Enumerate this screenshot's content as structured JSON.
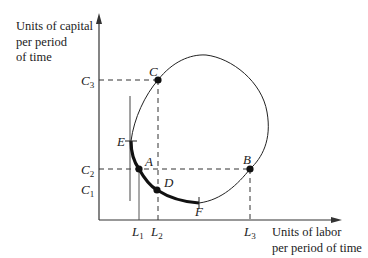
{
  "y_axis": {
    "label_lines": [
      "Units of capital",
      "per period",
      "of time"
    ]
  },
  "x_axis": {
    "label_lines": [
      "Units of labor",
      "per period of time"
    ]
  },
  "y_ticks": [
    {
      "main": "C",
      "sub": "3",
      "y": 80
    },
    {
      "main": "C",
      "sub": "2",
      "y": 169
    },
    {
      "main": "C",
      "sub": "1",
      "y": 190
    }
  ],
  "x_ticks": [
    {
      "main": "L",
      "sub": "1",
      "x": 139
    },
    {
      "main": "L",
      "sub": "2",
      "x": 157
    },
    {
      "main": "L",
      "sub": "3",
      "x": 250
    }
  ],
  "points": [
    {
      "name": "C",
      "x": 158,
      "y": 80,
      "dot": true
    },
    {
      "name": "A",
      "x": 139,
      "y": 169,
      "dot": true
    },
    {
      "name": "B",
      "x": 250,
      "y": 169,
      "dot": true
    },
    {
      "name": "D",
      "x": 157,
      "y": 190,
      "dot": true
    },
    {
      "name": "E",
      "x": 131,
      "y": 141,
      "dot": false
    },
    {
      "name": "F",
      "x": 199,
      "y": 203,
      "dot": false
    }
  ],
  "colors": {
    "axis": "#333333",
    "curve": "#222222",
    "tangent_line_left": "#5b6fc8",
    "tangent_line_right": "#6b7a55"
  }
}
